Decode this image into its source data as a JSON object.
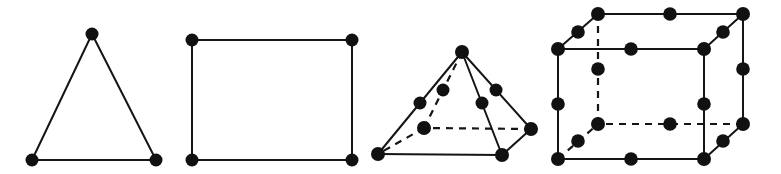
{
  "figure": {
    "background_color": "#ffffff",
    "line_color": "#151515",
    "node_color": "#111111",
    "canvas": {
      "width": 781,
      "height": 174
    },
    "shapes": [
      {
        "id": "triangle",
        "name": "triangle",
        "label": "Triangle with 3 corner nodes",
        "node_count": 3,
        "edge_count": 3,
        "node_radius": 6.5,
        "vertices": [
          {
            "name": "apex",
            "x": 92,
            "y": 34
          },
          {
            "name": "bottom-left",
            "x": 32,
            "y": 160
          },
          {
            "name": "bottom-right",
            "x": 156,
            "y": 160
          }
        ],
        "edges": [
          {
            "from": 0,
            "to": 1,
            "style": "solid"
          },
          {
            "from": 0,
            "to": 2,
            "style": "solid"
          },
          {
            "from": 1,
            "to": 2,
            "style": "solid"
          }
        ],
        "nodes": [
          {
            "x": 92,
            "y": 34,
            "r": 6.5
          },
          {
            "x": 32,
            "y": 160,
            "r": 6.5
          },
          {
            "x": 156,
            "y": 160,
            "r": 6.5
          }
        ]
      },
      {
        "id": "square",
        "name": "square",
        "label": "Square with 4 corner nodes",
        "node_count": 4,
        "edge_count": 4,
        "node_radius": 6.5,
        "vertices": [
          {
            "name": "top-left",
            "x": 192,
            "y": 40
          },
          {
            "name": "top-right",
            "x": 352,
            "y": 40
          },
          {
            "name": "bottom-right",
            "x": 352,
            "y": 160
          },
          {
            "name": "bottom-left",
            "x": 192,
            "y": 160
          }
        ],
        "edges": [
          {
            "from": 0,
            "to": 1,
            "style": "solid"
          },
          {
            "from": 1,
            "to": 2,
            "style": "solid"
          },
          {
            "from": 2,
            "to": 3,
            "style": "solid"
          },
          {
            "from": 3,
            "to": 0,
            "style": "solid"
          }
        ],
        "nodes": [
          {
            "x": 192,
            "y": 40,
            "r": 6.5
          },
          {
            "x": 352,
            "y": 40,
            "r": 6.5
          },
          {
            "x": 352,
            "y": 160,
            "r": 6.5
          },
          {
            "x": 192,
            "y": 160,
            "r": 6.5
          }
        ]
      },
      {
        "id": "pyramid",
        "name": "square-pyramid",
        "label": "Square pyramid with corner and edge-midpoint nodes",
        "node_count": 13,
        "edge_count": 8,
        "node_radius": 7,
        "vertices": [
          {
            "name": "apex",
            "x": 462,
            "y": 52
          },
          {
            "name": "base-front-left",
            "x": 378,
            "y": 154
          },
          {
            "name": "base-front-right",
            "x": 502,
            "y": 155
          },
          {
            "name": "base-back-right",
            "x": 531,
            "y": 129
          },
          {
            "name": "base-back-left",
            "x": 424,
            "y": 128
          }
        ],
        "edges": [
          {
            "from": 0,
            "to": 1,
            "style": "solid"
          },
          {
            "from": 0,
            "to": 2,
            "style": "solid"
          },
          {
            "from": 0,
            "to": 3,
            "style": "solid"
          },
          {
            "from": 0,
            "to": 4,
            "style": "dashed"
          },
          {
            "from": 1,
            "to": 2,
            "style": "solid"
          },
          {
            "from": 2,
            "to": 3,
            "style": "solid"
          },
          {
            "from": 3,
            "to": 4,
            "style": "dashed"
          },
          {
            "from": 4,
            "to": 1,
            "style": "dashed"
          }
        ],
        "nodes": [
          {
            "x": 462,
            "y": 52,
            "r": 7,
            "kind": "apex"
          },
          {
            "x": 378,
            "y": 154,
            "r": 7,
            "kind": "corner"
          },
          {
            "x": 502,
            "y": 155,
            "r": 7,
            "kind": "corner"
          },
          {
            "x": 531,
            "y": 129,
            "r": 7,
            "kind": "corner"
          },
          {
            "x": 420,
            "y": 103,
            "r": 6.5,
            "kind": "midpoint"
          },
          {
            "x": 482,
            "y": 103,
            "r": 6.5,
            "kind": "midpoint"
          },
          {
            "x": 496,
            "y": 90,
            "r": 6.5,
            "kind": "midpoint"
          },
          {
            "x": 443,
            "y": 90,
            "r": 6.5,
            "kind": "midpoint"
          },
          {
            "x": 424,
            "y": 128,
            "r": 7,
            "kind": "corner-hidden"
          }
        ]
      },
      {
        "id": "cube",
        "name": "cube",
        "label": "Cube with 8 corner nodes and 12 edge-midpoint nodes",
        "node_count": 20,
        "edge_count": 12,
        "node_radius": 7,
        "vertices": [
          {
            "name": "front-top-left",
            "x": 558,
            "y": 49
          },
          {
            "name": "front-top-right",
            "x": 704,
            "y": 49
          },
          {
            "name": "front-bottom-right",
            "x": 704,
            "y": 159
          },
          {
            "name": "front-bottom-left",
            "x": 558,
            "y": 159
          },
          {
            "name": "back-top-left",
            "x": 598,
            "y": 14
          },
          {
            "name": "back-top-right",
            "x": 743,
            "y": 14
          },
          {
            "name": "back-bottom-right",
            "x": 743,
            "y": 124
          },
          {
            "name": "back-bottom-left",
            "x": 598,
            "y": 124
          }
        ],
        "edges": [
          {
            "from": 0,
            "to": 1,
            "style": "solid"
          },
          {
            "from": 1,
            "to": 2,
            "style": "solid"
          },
          {
            "from": 2,
            "to": 3,
            "style": "solid"
          },
          {
            "from": 3,
            "to": 0,
            "style": "solid"
          },
          {
            "from": 4,
            "to": 5,
            "style": "solid"
          },
          {
            "from": 5,
            "to": 6,
            "style": "solid"
          },
          {
            "from": 6,
            "to": 7,
            "style": "dashed"
          },
          {
            "from": 7,
            "to": 4,
            "style": "dashed"
          },
          {
            "from": 0,
            "to": 4,
            "style": "solid"
          },
          {
            "from": 1,
            "to": 5,
            "style": "solid"
          },
          {
            "from": 2,
            "to": 6,
            "style": "solid"
          },
          {
            "from": 3,
            "to": 7,
            "style": "dashed"
          }
        ],
        "nodes": [
          {
            "x": 558,
            "y": 49,
            "r": 7,
            "kind": "corner"
          },
          {
            "x": 704,
            "y": 49,
            "r": 7,
            "kind": "corner"
          },
          {
            "x": 704,
            "y": 159,
            "r": 7,
            "kind": "corner"
          },
          {
            "x": 558,
            "y": 159,
            "r": 7,
            "kind": "corner"
          },
          {
            "x": 598,
            "y": 14,
            "r": 7,
            "kind": "corner"
          },
          {
            "x": 743,
            "y": 14,
            "r": 7,
            "kind": "corner"
          },
          {
            "x": 743,
            "y": 124,
            "r": 7,
            "kind": "corner"
          },
          {
            "x": 598,
            "y": 124,
            "r": 7,
            "kind": "corner-hidden"
          },
          {
            "x": 631,
            "y": 49,
            "r": 6.8,
            "kind": "midpoint"
          },
          {
            "x": 704,
            "y": 104,
            "r": 6.8,
            "kind": "midpoint"
          },
          {
            "x": 631,
            "y": 159,
            "r": 6.8,
            "kind": "midpoint"
          },
          {
            "x": 558,
            "y": 104,
            "r": 6.8,
            "kind": "midpoint"
          },
          {
            "x": 670,
            "y": 14,
            "r": 6.8,
            "kind": "midpoint"
          },
          {
            "x": 743,
            "y": 69,
            "r": 6.8,
            "kind": "midpoint"
          },
          {
            "x": 670,
            "y": 124,
            "r": 6.8,
            "kind": "midpoint-hidden"
          },
          {
            "x": 598,
            "y": 69,
            "r": 6.8,
            "kind": "midpoint-hidden"
          },
          {
            "x": 578,
            "y": 32,
            "r": 6.8,
            "kind": "midpoint"
          },
          {
            "x": 723,
            "y": 32,
            "r": 6.8,
            "kind": "midpoint"
          },
          {
            "x": 723,
            "y": 141,
            "r": 6.8,
            "kind": "midpoint"
          },
          {
            "x": 578,
            "y": 141,
            "r": 6.8,
            "kind": "midpoint-hidden"
          }
        ]
      }
    ]
  }
}
